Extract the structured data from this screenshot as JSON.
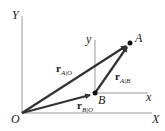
{
  "labels": {
    "Y": "Y",
    "X": "X",
    "O": "O",
    "y": "y",
    "x": "x",
    "A": "A",
    "B": "B"
  },
  "vectors": {
    "rAO": {
      "main": "r",
      "sub": "A|O"
    },
    "rAB": {
      "main": "r",
      "sub": "A|B"
    },
    "rBO": {
      "main": "r",
      "sub": "B|O"
    }
  },
  "colors": {
    "axis": "#888888",
    "vector": "#333333"
  }
}
